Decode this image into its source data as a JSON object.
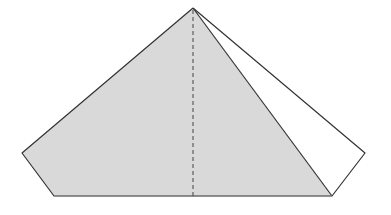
{
  "diagram": {
    "type": "geometric-figure",
    "colors": {
      "background": "#ffffff",
      "shaded_fill": "#d9d9d9",
      "stroke": "#333333",
      "dashed_stroke": "#444444"
    },
    "vertices": {
      "apex": [
        193,
        8
      ],
      "left": [
        22,
        153
      ],
      "bottom_left": [
        54,
        196
      ],
      "bottom_right": [
        332,
        196
      ],
      "right": [
        365,
        153
      ],
      "altitude_foot": [
        193,
        196
      ]
    },
    "labels": []
  }
}
